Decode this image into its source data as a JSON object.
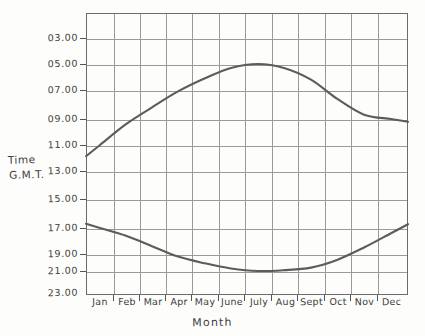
{
  "axes": {
    "y_title_line1": "Time",
    "y_title_line2": "G.M.T.",
    "x_title": "Month"
  },
  "chart_data": {
    "type": "line",
    "title": "",
    "subtitle": "",
    "xlabel": "Month",
    "ylabel": "Time G.M.T.",
    "grid": true,
    "legend_position": "none",
    "x_tick_labels": [
      "Jan",
      "Feb",
      "Mar",
      "Apr",
      "May",
      "June",
      "July",
      "Aug",
      "Sept",
      "Oct",
      "Nov",
      "Dec"
    ],
    "y_tick_labels": [
      "03.00",
      "05.00",
      "07.00",
      "09.00",
      "11.00",
      "13.00",
      "15.00",
      "17.00",
      "19.00",
      "21.00",
      "23.00"
    ],
    "y_tick_values": [
      3,
      5,
      7,
      9,
      11,
      13,
      15,
      17,
      19,
      21,
      23
    ],
    "ylim": [
      2,
      24
    ],
    "y_inverted": false,
    "xlim": [
      "Jan",
      "Dec"
    ],
    "categories": [
      "Jan",
      "Feb",
      "Mar",
      "Apr",
      "May",
      "June",
      "July",
      "Aug",
      "Sept",
      "Oct",
      "Nov",
      "Dec"
    ],
    "series": [
      {
        "name": "Morning curve",
        "values": [
          11.0,
          9.4,
          8.2,
          7.1,
          6.1,
          5.3,
          5.0,
          5.3,
          6.2,
          7.6,
          8.7,
          9.0
        ]
      },
      {
        "name": "Evening curve",
        "values": [
          17.0,
          17.6,
          18.4,
          19.3,
          20.1,
          20.7,
          21.0,
          20.9,
          20.6,
          19.7,
          18.5,
          17.4
        ]
      }
    ],
    "annotations": []
  },
  "ticks": {
    "y_pixel_positions": [
      38,
      64,
      90,
      119,
      145,
      171,
      199,
      228,
      254,
      271,
      293
    ],
    "x_pixel_positions": [
      100,
      126,
      152,
      178,
      205,
      231,
      258,
      284,
      311,
      337,
      364,
      391
    ]
  }
}
